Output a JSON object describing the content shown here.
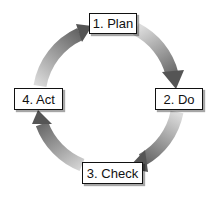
{
  "diagram": {
    "steps": [
      {
        "label": "1. Plan"
      },
      {
        "label": "2. Do"
      },
      {
        "label": "3. Check"
      },
      {
        "label": "4. Act"
      }
    ],
    "colors": {
      "arrow_light": "#d8d8d8",
      "arrow_dark": "#5a5a5a",
      "box_border": "#111111",
      "box_fill": "#ffffff"
    }
  }
}
